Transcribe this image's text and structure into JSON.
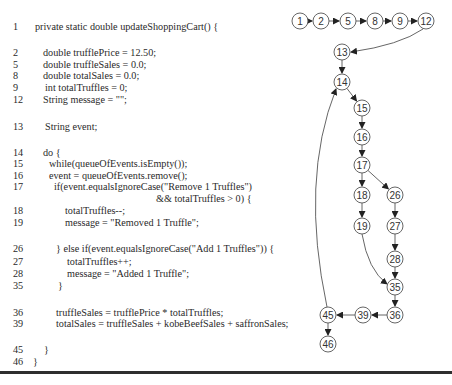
{
  "code": {
    "lines": [
      {
        "num": "1",
        "text": "private static double updateShoppingCart() {",
        "top": 21,
        "indent": 35
      },
      {
        "num": "2",
        "text": "double trufflePrice = 12.50;",
        "top": 47,
        "indent": 43
      },
      {
        "num": "5",
        "text": "double truffleSales = 0.0;",
        "top": 59,
        "indent": 43
      },
      {
        "num": "8",
        "text": "double totalSales = 0.0;",
        "top": 70,
        "indent": 43
      },
      {
        "num": "9",
        "text": "int totalTruffles = 0;",
        "top": 82,
        "indent": 45
      },
      {
        "num": "12",
        "text": "String message = \"\";",
        "top": 94,
        "indent": 43
      },
      {
        "num": "13",
        "text": "String event;",
        "top": 121,
        "indent": 45
      },
      {
        "num": "14",
        "text": "do {",
        "top": 147,
        "indent": 43
      },
      {
        "num": "15",
        "text": "while(queueOfEvents.isEmpty());",
        "top": 158,
        "indent": 49
      },
      {
        "num": "16",
        "text": "event = queueOfEvents.remove();",
        "top": 170,
        "indent": 49
      },
      {
        "num": "17",
        "text": "if(event.equalsIgnoreCase(\"Remove 1 Truffles\")",
        "top": 181,
        "indent": 54
      },
      {
        "num": "",
        "text": "&& totalTruffles > 0) {",
        "top": 193,
        "indent": 156
      },
      {
        "num": "18",
        "text": "totalTruffles--;",
        "top": 205,
        "indent": 65
      },
      {
        "num": "19",
        "text": "message = \"Removed 1 Truffle\";",
        "top": 217,
        "indent": 65
      },
      {
        "num": "26",
        "text": "} else if(event.equalsIgnoreCase(\"Add 1 Truffles\")) {",
        "top": 243,
        "indent": 56
      },
      {
        "num": "27",
        "text": "totalTruffles++;",
        "top": 256,
        "indent": 67
      },
      {
        "num": "28",
        "text": "message = \"Added 1 Truffle\";",
        "top": 268,
        "indent": 67
      },
      {
        "num": "35",
        "text": "}",
        "top": 280,
        "indent": 58
      },
      {
        "num": "36",
        "text": "truffleSales = trufflePrice * totalTruffles;",
        "top": 307,
        "indent": 56
      },
      {
        "num": "39",
        "text": "totalSales = truffleSales + kobeBeefSales + saffronSales;",
        "top": 318,
        "indent": 56
      },
      {
        "num": "45",
        "text": "}",
        "top": 344,
        "indent": 44
      },
      {
        "num": "46",
        "text": "}",
        "top": 356,
        "indent": 33
      }
    ]
  },
  "graph": {
    "node_radius": 8,
    "stroke_color": "#555555",
    "nodes": [
      {
        "id": "1",
        "x": 300,
        "y": 21
      },
      {
        "id": "2",
        "x": 321,
        "y": 21
      },
      {
        "id": "5",
        "x": 348,
        "y": 21
      },
      {
        "id": "8",
        "x": 375,
        "y": 21
      },
      {
        "id": "9",
        "x": 400,
        "y": 21
      },
      {
        "id": "12",
        "x": 426,
        "y": 21
      },
      {
        "id": "13",
        "x": 342,
        "y": 52
      },
      {
        "id": "14",
        "x": 342,
        "y": 82
      },
      {
        "id": "15",
        "x": 362,
        "y": 108
      },
      {
        "id": "16",
        "x": 362,
        "y": 137
      },
      {
        "id": "17",
        "x": 362,
        "y": 165
      },
      {
        "id": "18",
        "x": 362,
        "y": 195
      },
      {
        "id": "26",
        "x": 395,
        "y": 195
      },
      {
        "id": "19",
        "x": 362,
        "y": 226
      },
      {
        "id": "27",
        "x": 395,
        "y": 226
      },
      {
        "id": "28",
        "x": 395,
        "y": 259
      },
      {
        "id": "35",
        "x": 395,
        "y": 287
      },
      {
        "id": "36",
        "x": 395,
        "y": 315
      },
      {
        "id": "39",
        "x": 363,
        "y": 315
      },
      {
        "id": "45",
        "x": 328,
        "y": 315
      },
      {
        "id": "46",
        "x": 328,
        "y": 344
      }
    ],
    "edges": [
      {
        "from": "1",
        "to": "2"
      },
      {
        "from": "2",
        "to": "5"
      },
      {
        "from": "5",
        "to": "8"
      },
      {
        "from": "8",
        "to": "9"
      },
      {
        "from": "9",
        "to": "12"
      },
      {
        "from": "12",
        "to": "13",
        "curve": "M 423 29 Q 400 45 351 52"
      },
      {
        "from": "13",
        "to": "14"
      },
      {
        "from": "14",
        "to": "15"
      },
      {
        "from": "15",
        "to": "16"
      },
      {
        "from": "16",
        "to": "17"
      },
      {
        "from": "17",
        "to": "18"
      },
      {
        "from": "17",
        "to": "26"
      },
      {
        "from": "18",
        "to": "19"
      },
      {
        "from": "26",
        "to": "27"
      },
      {
        "from": "27",
        "to": "28"
      },
      {
        "from": "28",
        "to": "35"
      },
      {
        "from": "19",
        "to": "35",
        "curve": "M 362 234 Q 368 270 387 284"
      },
      {
        "from": "35",
        "to": "36"
      },
      {
        "from": "36",
        "to": "39"
      },
      {
        "from": "39",
        "to": "45"
      },
      {
        "from": "45",
        "to": "46"
      },
      {
        "from": "45",
        "to": "14",
        "curve": "M 327 307 Q 300 180 336 89"
      }
    ]
  }
}
